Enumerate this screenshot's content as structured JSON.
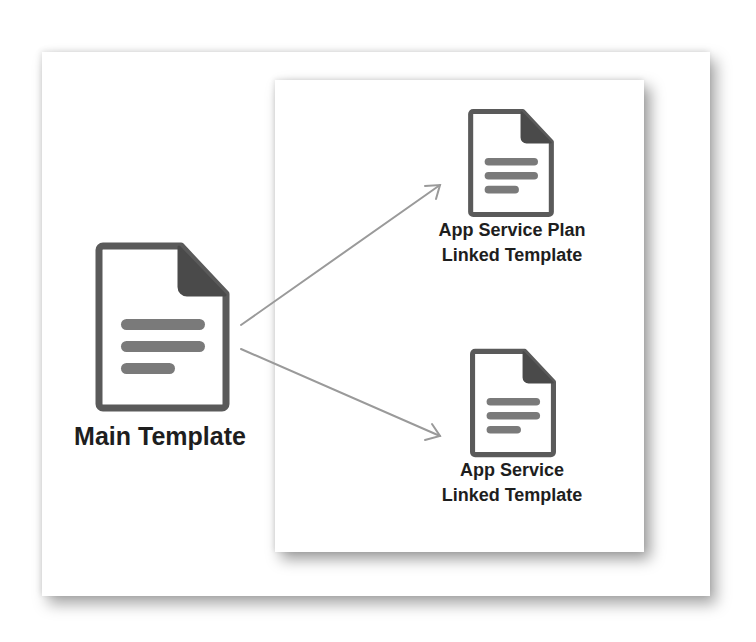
{
  "diagram": {
    "type": "template-linking",
    "colors": {
      "icon_outline": "#5a5a5a",
      "icon_fold": "#4a4a4a",
      "icon_lines": "#7a7a7a",
      "arrow": "#9a9a9a",
      "text": "#1e1e1e",
      "background": "#ffffff"
    },
    "nodes": [
      {
        "id": "main",
        "icon": "document-icon",
        "label_lines": [
          "Main Template"
        ]
      },
      {
        "id": "app-service-plan",
        "icon": "document-icon",
        "label_lines": [
          "App Service Plan",
          "Linked Template"
        ]
      },
      {
        "id": "app-service",
        "icon": "document-icon",
        "label_lines": [
          "App Service",
          "Linked Template"
        ]
      }
    ],
    "edges": [
      {
        "from": "main",
        "to": "app-service-plan",
        "style": "arrow"
      },
      {
        "from": "main",
        "to": "app-service",
        "style": "arrow"
      }
    ]
  }
}
